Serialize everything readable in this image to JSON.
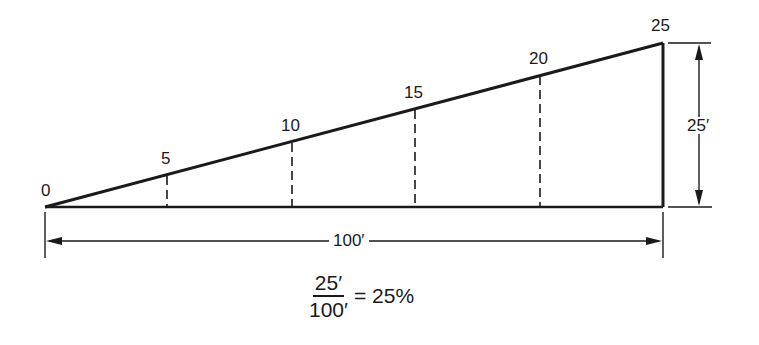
{
  "diagram": {
    "point_labels": [
      {
        "text": "0",
        "x": 41,
        "y": 182
      },
      {
        "text": "5",
        "x": 161,
        "y": 150
      },
      {
        "text": "10",
        "x": 280,
        "y": 117
      },
      {
        "text": "15",
        "x": 403,
        "y": 84
      },
      {
        "text": "20",
        "x": 528,
        "y": 50
      },
      {
        "text": "25",
        "x": 651,
        "y": 16
      }
    ],
    "vertical_dimension": {
      "label": "25′"
    },
    "horizontal_dimension": {
      "label": "100′"
    },
    "formula": {
      "numerator": "25′",
      "denominator": "100′",
      "result": "= 25%"
    },
    "colors": {
      "line": "#1a1a1a",
      "background": "#ffffff"
    }
  }
}
